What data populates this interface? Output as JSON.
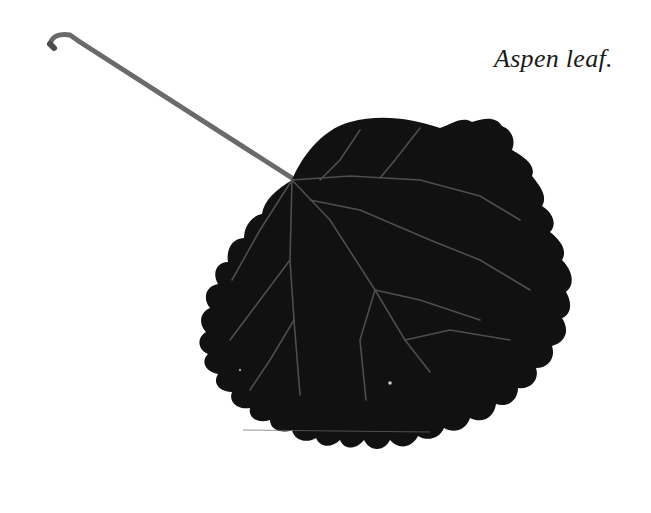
{
  "caption": "Aspen leaf.",
  "figure": {
    "colors": {
      "background": "#ffffff",
      "leaf_fill": "#101010",
      "stem": "#6b6b6b",
      "veins": "#5a5a5a",
      "caption_text": "#1a1a1a"
    }
  }
}
